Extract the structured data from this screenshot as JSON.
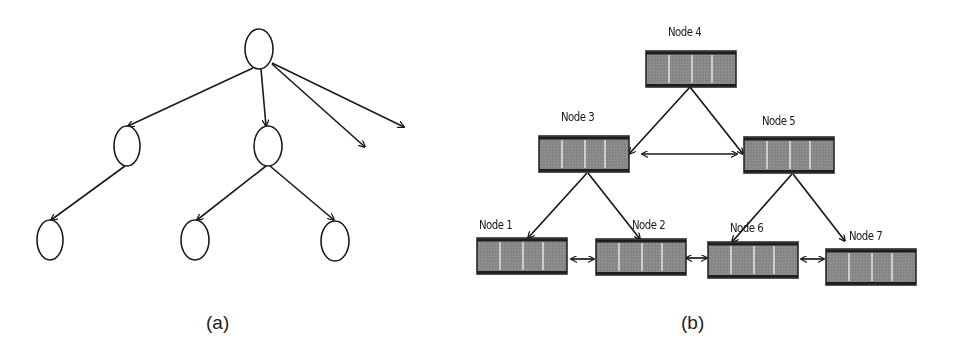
{
  "figure": {
    "panel_a": {
      "caption": "(a)",
      "type": "tree",
      "nodes": [
        {
          "id": "root",
          "cx": 259,
          "cy": 49
        },
        {
          "id": "child-left",
          "cx": 127,
          "cy": 146
        },
        {
          "id": "child-middle",
          "cx": 268,
          "cy": 146
        },
        {
          "id": "leaf-1",
          "cx": 50,
          "cy": 240
        },
        {
          "id": "leaf-2",
          "cx": 195,
          "cy": 240
        },
        {
          "id": "leaf-3",
          "cx": 335,
          "cy": 240
        }
      ],
      "edges": [
        {
          "from": "root",
          "to": "child-left"
        },
        {
          "from": "root",
          "to": "child-middle"
        },
        {
          "from": "root",
          "to": "dangling-1"
        },
        {
          "from": "root",
          "to": "dangling-2"
        },
        {
          "from": "child-left",
          "to": "leaf-1"
        },
        {
          "from": "child-middle",
          "to": "leaf-2"
        },
        {
          "from": "child-middle",
          "to": "leaf-3"
        }
      ]
    },
    "panel_b": {
      "caption": "(b)",
      "type": "linked-tree-of-arrays",
      "nodes": [
        {
          "id": "node-4",
          "label": "Node 4",
          "x": 646,
          "y": 51
        },
        {
          "id": "node-3",
          "label": "Node 3",
          "x": 539,
          "y": 136
        },
        {
          "id": "node-5",
          "label": "Node 5",
          "x": 744,
          "y": 137
        },
        {
          "id": "node-1",
          "label": "Node 1",
          "x": 477,
          "y": 238
        },
        {
          "id": "node-2",
          "label": "Node 2",
          "x": 596,
          "y": 239
        },
        {
          "id": "node-6",
          "label": "Node 6",
          "x": 708,
          "y": 242
        },
        {
          "id": "node-7",
          "label": "Node 7",
          "x": 826,
          "y": 249
        }
      ],
      "tree_edges": [
        {
          "from": "Node 4",
          "to": "Node 3"
        },
        {
          "from": "Node 4",
          "to": "Node 5"
        },
        {
          "from": "Node 3",
          "to": "Node 1"
        },
        {
          "from": "Node 3",
          "to": "Node 2"
        },
        {
          "from": "Node 5",
          "to": "Node 6"
        },
        {
          "from": "Node 5",
          "to": "Node 7"
        }
      ],
      "sibling_links": [
        {
          "a": "Node 3",
          "b": "Node 5"
        },
        {
          "a": "Node 1",
          "b": "Node 2"
        },
        {
          "a": "Node 2",
          "b": "Node 6"
        },
        {
          "a": "Node 6",
          "b": "Node 7"
        }
      ],
      "cells_per_node": 4
    },
    "colors": {
      "node_fill": "#8a8a8a",
      "node_border": "#1e1e1e",
      "divider": "#f2f2f2",
      "stroke": "#1a1a1a"
    }
  }
}
